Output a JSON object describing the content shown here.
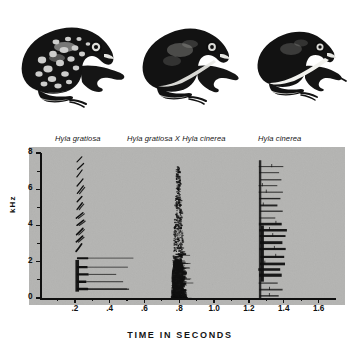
{
  "figure": {
    "type": "spectrogram-figure",
    "background_color": "#ffffff",
    "panel_color": "#b4b4b2",
    "ink_color": "#101010"
  },
  "specimens": [
    {
      "id": "gratiosa",
      "label": "Hyla gratiosa",
      "icon": "frog-illustration-spotted",
      "pattern": "heavily spotted dorsum, stout body"
    },
    {
      "id": "hybrid",
      "label": "Hyla gratiosa X Hyla cinerea",
      "icon": "frog-illustration-hybrid",
      "pattern": "dark dorsum with partial pale lateral stripe"
    },
    {
      "id": "cinerea",
      "label": "Hyla cinerea",
      "icon": "frog-illustration-striped",
      "pattern": "slender body with bold white lateral stripe"
    }
  ],
  "chart_data": {
    "type": "heatmap",
    "subtype": "audio-spectrogram",
    "title": "",
    "xlabel": "TIME IN SECONDS",
    "ylabel": "kHz",
    "xlim": [
      0,
      1.7
    ],
    "ylim": [
      0,
      8
    ],
    "grid": false,
    "legend": "none",
    "x_ticks": [
      0.2,
      0.4,
      0.6,
      0.8,
      1.0,
      1.2,
      1.4,
      1.6
    ],
    "x_tick_labels": [
      ".2",
      ".4",
      ".6",
      ".8",
      "1.0",
      "1.2",
      "1.4",
      "1.6"
    ],
    "x_minor_ticks": [
      0.1,
      0.3,
      0.5,
      0.7,
      0.9,
      1.1,
      1.3,
      1.5
    ],
    "y_ticks": [
      0,
      2,
      4,
      6,
      8
    ],
    "y_tick_labels": [
      "0",
      "2",
      "4",
      "6",
      "8"
    ],
    "y_minor_ticks": [
      1,
      3,
      5,
      7
    ],
    "calls": [
      {
        "name": "Hyla gratiosa",
        "species_id": "gratiosa",
        "time_start": 0.17,
        "time_end": 0.5,
        "pulse_center": 0.235,
        "freq_min": 0.4,
        "freq_max": 7.9,
        "description": "pulsed call with stacked harmonic chevrons; strong energy bands below 2 kHz with trailing horizontal smears to 0.5 s",
        "harmonic_bands_khz": [
          0.5,
          0.9,
          1.3,
          1.7,
          2.2,
          2.7,
          3.2,
          3.6,
          4.1,
          4.5,
          5.0,
          5.4,
          5.9,
          6.3,
          6.8,
          7.2,
          7.6
        ],
        "dominant_freq_khz": 0.9
      },
      {
        "name": "Hyla gratiosa X Hyla cinerea",
        "species_id": "hybrid",
        "time_start": 0.73,
        "time_end": 0.92,
        "pulse_center": 0.79,
        "freq_min": 0.0,
        "freq_max": 7.3,
        "description": "broadband noisy burst, densest energy from 0 to 2.5 kHz with scattered speckle up to 7 kHz",
        "dominant_freq_khz": 1.4
      },
      {
        "name": "Hyla cinerea",
        "species_id": "cinerea",
        "time_start": 1.26,
        "time_end": 1.42,
        "pulse_center": 1.33,
        "freq_min": 0.0,
        "freq_max": 7.6,
        "description": "dense stacked horizontal harmonic bands through the full frequency range, strongest from 1 to 4 kHz",
        "dominant_freq_khz": 2.9
      }
    ]
  }
}
